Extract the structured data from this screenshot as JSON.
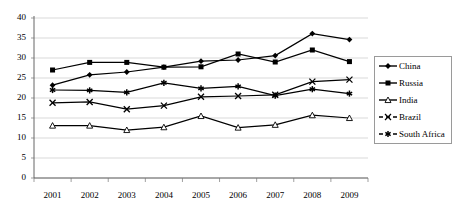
{
  "chart_data": {
    "type": "line",
    "title": "",
    "subtitle": "",
    "xlabel": "",
    "ylabel": "",
    "categories": [
      "2001",
      "2002",
      "2003",
      "2004",
      "2005",
      "2006",
      "2007",
      "2008",
      "2009"
    ],
    "ylim": [
      0,
      40
    ],
    "yticks": [
      0,
      5,
      10,
      15,
      20,
      25,
      30,
      35,
      40
    ],
    "ytick_labels": [
      "0",
      "5",
      "10",
      "15",
      "20",
      "25",
      "30",
      "35",
      "40"
    ],
    "grid": true,
    "grid_axis": "y",
    "legend_position": "right",
    "series": [
      {
        "name": "China",
        "marker": "diamond",
        "color": "#000000",
        "dash": false,
        "values": [
          23.2,
          25.8,
          26.5,
          27.7,
          29.2,
          29.5,
          30.6,
          36.1,
          34.6
        ]
      },
      {
        "name": "Russia",
        "marker": "square",
        "color": "#000000",
        "dash": false,
        "values": [
          27.0,
          28.9,
          28.9,
          27.7,
          27.8,
          31.0,
          29.0,
          32.0,
          29.1
        ]
      },
      {
        "name": "India",
        "marker": "triangle",
        "color": "#000000",
        "dash": false,
        "values": [
          13.1,
          13.1,
          12.0,
          12.7,
          15.5,
          12.6,
          13.3,
          15.7,
          15.0
        ]
      },
      {
        "name": "Brazil",
        "marker": "cross",
        "color": "#000000",
        "dash": true,
        "values": [
          18.8,
          19.0,
          17.2,
          18.1,
          20.3,
          20.5,
          20.8,
          24.1,
          24.6
        ]
      },
      {
        "name": "South Africa",
        "marker": "asterisk",
        "color": "#000000",
        "dash": true,
        "values": [
          22.0,
          21.9,
          21.4,
          23.8,
          22.4,
          22.9,
          20.6,
          22.2,
          21.1
        ]
      }
    ]
  },
  "legend": {
    "items": [
      {
        "label": "China"
      },
      {
        "label": "Russia"
      },
      {
        "label": "India"
      },
      {
        "label": "Brazil"
      },
      {
        "label": "South Africa"
      }
    ]
  }
}
